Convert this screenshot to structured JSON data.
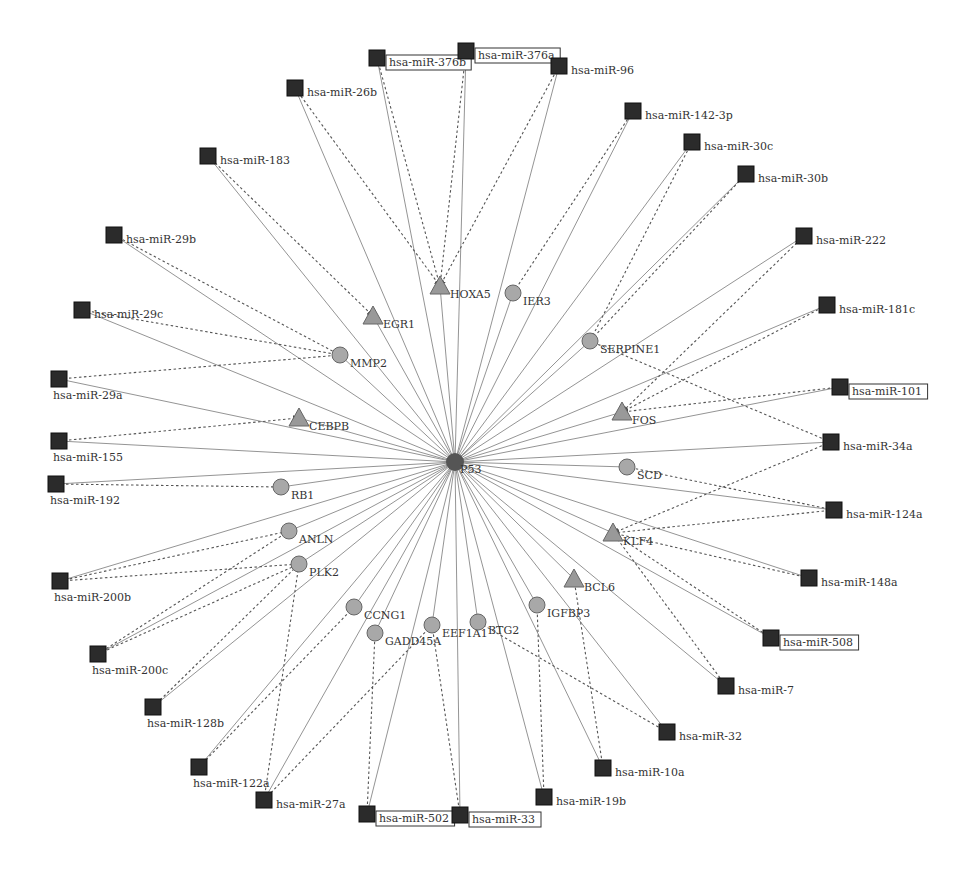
{
  "hub": {
    "id": "P53",
    "label": "P53",
    "x": 455,
    "y": 462
  },
  "genes": [
    {
      "id": "HOXA5",
      "label": "HOXA5",
      "x": 440,
      "y": 286,
      "shape": "triangle"
    },
    {
      "id": "IER3",
      "label": "IER3",
      "x": 513,
      "y": 293,
      "shape": "circle"
    },
    {
      "id": "EGR1",
      "label": "EGR1",
      "x": 373,
      "y": 316,
      "shape": "triangle"
    },
    {
      "id": "SERPINE1",
      "label": "SERPINE1",
      "x": 590,
      "y": 341,
      "shape": "circle"
    },
    {
      "id": "MMP2",
      "label": "MMP2",
      "x": 340,
      "y": 355,
      "shape": "circle"
    },
    {
      "id": "FOS",
      "label": "FOS",
      "x": 622,
      "y": 412,
      "shape": "triangle"
    },
    {
      "id": "CEBPB",
      "label": "CEBPB",
      "x": 299,
      "y": 418,
      "shape": "triangle"
    },
    {
      "id": "SCD",
      "label": "SCD",
      "x": 627,
      "y": 467,
      "shape": "circle"
    },
    {
      "id": "RB1",
      "label": "RB1",
      "x": 281,
      "y": 487,
      "shape": "circle"
    },
    {
      "id": "KLF4",
      "label": "KLF4",
      "x": 613,
      "y": 533,
      "shape": "triangle"
    },
    {
      "id": "ANLN",
      "label": "ANLN",
      "x": 289,
      "y": 531,
      "shape": "circle"
    },
    {
      "id": "PLK2",
      "label": "PLK2",
      "x": 299,
      "y": 564,
      "shape": "circle"
    },
    {
      "id": "BCL6",
      "label": "BCL6",
      "x": 574,
      "y": 579,
      "shape": "triangle"
    },
    {
      "id": "CCNG1",
      "label": "CCNG1",
      "x": 354,
      "y": 607,
      "shape": "circle"
    },
    {
      "id": "IGFBP3",
      "label": "IGFBP3",
      "x": 537,
      "y": 605,
      "shape": "circle"
    },
    {
      "id": "EEF1A1",
      "label": "EEF1A1",
      "x": 432,
      "y": 625,
      "shape": "circle"
    },
    {
      "id": "BTG2",
      "label": "BTG2",
      "x": 478,
      "y": 622,
      "shape": "circle"
    },
    {
      "id": "GADD45A",
      "label": "GADD45A",
      "x": 375,
      "y": 633,
      "shape": "circle"
    }
  ],
  "mirnas": [
    {
      "id": "miR-376b",
      "label": "hsa-miR-376b",
      "x": 377,
      "y": 58,
      "boxed": true
    },
    {
      "id": "miR-376a",
      "label": "hsa-miR-376a",
      "x": 466,
      "y": 51,
      "boxed": true
    },
    {
      "id": "miR-96",
      "label": "hsa-miR-96",
      "x": 559,
      "y": 66,
      "boxed": false
    },
    {
      "id": "miR-26b",
      "label": "hsa-miR-26b",
      "x": 295,
      "y": 88,
      "boxed": false
    },
    {
      "id": "miR-142-3p",
      "label": "hsa-miR-142-3p",
      "x": 633,
      "y": 111,
      "boxed": false
    },
    {
      "id": "miR-30c",
      "label": "hsa-miR-30c",
      "x": 692,
      "y": 142,
      "boxed": false
    },
    {
      "id": "miR-183",
      "label": "hsa-miR-183",
      "x": 208,
      "y": 156,
      "boxed": false
    },
    {
      "id": "miR-30b",
      "label": "hsa-miR-30b",
      "x": 746,
      "y": 174,
      "boxed": false
    },
    {
      "id": "miR-29b",
      "label": "hsa-miR-29b",
      "x": 114,
      "y": 235,
      "boxed": false
    },
    {
      "id": "miR-222",
      "label": "hsa-miR-222",
      "x": 804,
      "y": 236,
      "boxed": false
    },
    {
      "id": "miR-29c",
      "label": "hsa-miR-29c",
      "x": 82,
      "y": 310,
      "boxed": false
    },
    {
      "id": "miR-181c",
      "label": "hsa-miR-181c",
      "x": 827,
      "y": 305,
      "boxed": false
    },
    {
      "id": "miR-29a",
      "label": "hsa-miR-29a",
      "x": 59,
      "y": 379,
      "boxed": false
    },
    {
      "id": "miR-101",
      "label": "hsa-miR-101",
      "x": 840,
      "y": 387,
      "boxed": true
    },
    {
      "id": "miR-155",
      "label": "hsa-miR-155",
      "x": 59,
      "y": 441,
      "boxed": false
    },
    {
      "id": "miR-34a",
      "label": "hsa-miR-34a",
      "x": 831,
      "y": 442,
      "boxed": false
    },
    {
      "id": "miR-192",
      "label": "hsa-miR-192",
      "x": 56,
      "y": 484,
      "boxed": false
    },
    {
      "id": "miR-124a",
      "label": "hsa-miR-124a",
      "x": 834,
      "y": 510,
      "boxed": false
    },
    {
      "id": "miR-200b",
      "label": "hsa-miR-200b",
      "x": 60,
      "y": 581,
      "boxed": false
    },
    {
      "id": "miR-148a",
      "label": "hsa-miR-148a",
      "x": 809,
      "y": 578,
      "boxed": false
    },
    {
      "id": "miR-508",
      "label": "hsa-miR-508",
      "x": 771,
      "y": 638,
      "boxed": true
    },
    {
      "id": "miR-200c",
      "label": "hsa-miR-200c",
      "x": 98,
      "y": 654,
      "boxed": false
    },
    {
      "id": "miR-7",
      "label": "hsa-miR-7",
      "x": 726,
      "y": 686,
      "boxed": false
    },
    {
      "id": "miR-128b",
      "label": "hsa-miR-128b",
      "x": 153,
      "y": 707,
      "boxed": false
    },
    {
      "id": "miR-32",
      "label": "hsa-miR-32",
      "x": 667,
      "y": 732,
      "boxed": false
    },
    {
      "id": "miR-122a",
      "label": "hsa-miR-122a",
      "x": 199,
      "y": 767,
      "boxed": false
    },
    {
      "id": "miR-10a",
      "label": "hsa-miR-10a",
      "x": 603,
      "y": 768,
      "boxed": false
    },
    {
      "id": "miR-27a",
      "label": "hsa-miR-27a",
      "x": 264,
      "y": 800,
      "boxed": false
    },
    {
      "id": "miR-19b",
      "label": "hsa-miR-19b",
      "x": 544,
      "y": 797,
      "boxed": false
    },
    {
      "id": "miR-502",
      "label": "hsa-miR-502",
      "x": 367,
      "y": 814,
      "boxed": true
    },
    {
      "id": "miR-33",
      "label": "hsa-miR-33",
      "x": 460,
      "y": 815,
      "boxed": true
    }
  ],
  "dashed_edges": [
    [
      "miR-376b",
      "HOXA5"
    ],
    [
      "miR-376a",
      "HOXA5"
    ],
    [
      "miR-26b",
      "HOXA5"
    ],
    [
      "miR-96",
      "HOXA5"
    ],
    [
      "miR-142-3p",
      "IER3"
    ],
    [
      "miR-183",
      "EGR1"
    ],
    [
      "miR-30c",
      "SERPINE1"
    ],
    [
      "miR-30b",
      "SERPINE1"
    ],
    [
      "miR-29b",
      "MMP2"
    ],
    [
      "miR-29c",
      "MMP2"
    ],
    [
      "miR-29a",
      "MMP2"
    ],
    [
      "miR-222",
      "FOS"
    ],
    [
      "miR-181c",
      "FOS"
    ],
    [
      "miR-101",
      "FOS"
    ],
    [
      "miR-155",
      "CEBPB"
    ],
    [
      "miR-192",
      "RB1"
    ],
    [
      "miR-34a",
      "KLF4"
    ],
    [
      "miR-124a",
      "KLF4"
    ],
    [
      "miR-148a",
      "KLF4"
    ],
    [
      "miR-508",
      "KLF4"
    ],
    [
      "miR-7",
      "KLF4"
    ],
    [
      "miR-10a",
      "BCL6"
    ],
    [
      "miR-200b",
      "ANLN"
    ],
    [
      "miR-200c",
      "ANLN"
    ],
    [
      "miR-200b",
      "PLK2"
    ],
    [
      "miR-200c",
      "PLK2"
    ],
    [
      "miR-128b",
      "PLK2"
    ],
    [
      "miR-122a",
      "CCNG1"
    ],
    [
      "miR-27a",
      "PLK2"
    ],
    [
      "miR-27a",
      "EEF1A1"
    ],
    [
      "miR-502",
      "GADD45A"
    ],
    [
      "miR-33",
      "EEF1A1"
    ],
    [
      "miR-19b",
      "IGFBP3"
    ],
    [
      "miR-32",
      "BTG2"
    ],
    [
      "miR-124a",
      "SCD"
    ],
    [
      "miR-34a",
      "SERPINE1"
    ]
  ]
}
